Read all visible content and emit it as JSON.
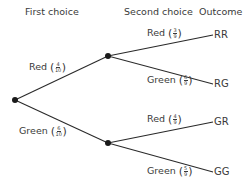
{
  "headings": {
    "first": "First choice",
    "second": "Second choice",
    "outcome": "Outcome"
  },
  "branches": {
    "first": [
      {
        "label": "Red",
        "num": "4",
        "den": "10"
      },
      {
        "label": "Green",
        "num": "6",
        "den": "10"
      }
    ],
    "second_after_red": [
      {
        "label": "Red",
        "num": "3",
        "den": "9"
      },
      {
        "label": "Green",
        "num": "6",
        "den": "9"
      }
    ],
    "second_after_green": [
      {
        "label": "Red",
        "num": "4",
        "den": "9"
      },
      {
        "label": "Green",
        "num": "5",
        "den": "9"
      }
    ]
  },
  "outcomes": [
    "RR",
    "RG",
    "GR",
    "GG"
  ],
  "colors": {
    "line": "#2a2a2a",
    "node": "#1a1a1a",
    "text": "#3a3a3a"
  }
}
